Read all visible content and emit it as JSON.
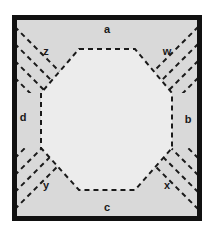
{
  "figure": {
    "canvas": {
      "width": 213,
      "height": 235,
      "background": "#ffffff"
    },
    "colors": {
      "page_background": "#ffffff",
      "frame_stroke": "#111111",
      "square_fill": "#d9d9d9",
      "octagon_fill": "#ececec",
      "octagon_stroke": "#1a1a1a",
      "hatch_stroke": "#1a1a1a",
      "label_color": "#1a1a1a"
    },
    "square": {
      "x": 12,
      "y": 15,
      "width": 190,
      "height": 206,
      "border_width": 5,
      "style": "solid"
    },
    "octagon": {
      "style": "dashed",
      "stroke_width": 2,
      "dash_pattern": "5 4",
      "points": "79,49 135,49 172,93 172,148 135,190 79,190 41,148 41,93"
    },
    "hatching": {
      "style": "diagonal-parallel-dashed-lines",
      "line_count_per_corner": 4,
      "stroke_width": 2,
      "dash_pattern": "5 4",
      "corners": [
        "top-left",
        "top-right",
        "bottom-left",
        "bottom-right"
      ]
    },
    "labels": [
      {
        "id": "a",
        "text": "a",
        "position": "top-edge",
        "x": 107,
        "y": 30
      },
      {
        "id": "b",
        "text": "b",
        "position": "right-edge",
        "x": 188,
        "y": 120
      },
      {
        "id": "c",
        "text": "c",
        "position": "bottom-edge",
        "x": 107,
        "y": 208
      },
      {
        "id": "d",
        "text": "d",
        "position": "left-edge",
        "x": 23,
        "y": 118
      },
      {
        "id": "w",
        "text": "w",
        "position": "top-right-corner",
        "x": 167,
        "y": 52
      },
      {
        "id": "x",
        "text": "x",
        "position": "bottom-right-corner",
        "x": 167,
        "y": 186
      },
      {
        "id": "y",
        "text": "y",
        "position": "bottom-left-corner",
        "x": 46,
        "y": 186
      },
      {
        "id": "z",
        "text": "z",
        "position": "top-left-corner",
        "x": 46,
        "y": 52
      }
    ]
  }
}
